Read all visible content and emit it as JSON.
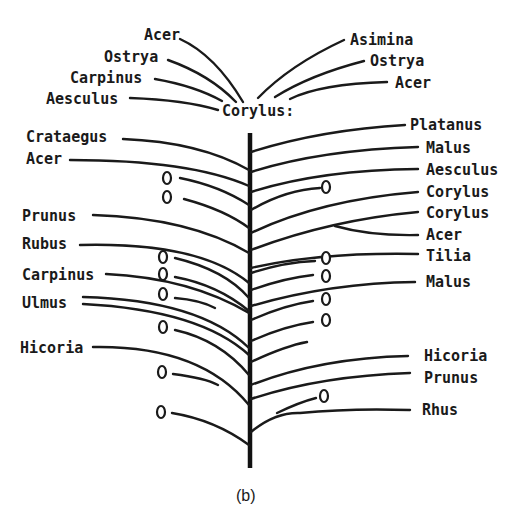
{
  "figure": {
    "caption": "(b)",
    "root_label": "Corylus:",
    "top_left_labels": [
      "Acer",
      "Ostrya",
      "Carpinus",
      "Aesculus"
    ],
    "top_right_labels": [
      "Asimina",
      "Ostrya",
      "Acer"
    ],
    "left_labels": [
      "Crataegus",
      "Acer",
      "Prunus",
      "Rubus",
      "Carpinus",
      "Ulmus",
      "Hicoria"
    ],
    "right_labels": [
      "Platanus",
      "Malus",
      "Aesculus",
      "Corylus",
      "Corylus",
      "Acer",
      "Tilia",
      "Malus",
      "Hicoria",
      "Prunus",
      "Rhus"
    ],
    "oval_marker": "Q",
    "left_oval_count": 9,
    "right_oval_count": 6
  }
}
